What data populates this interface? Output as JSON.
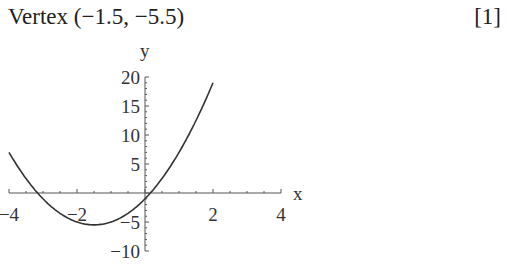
{
  "answer": {
    "text": "Vertex (−1.5, −5.5)",
    "mark": "[1]"
  },
  "chart_data": {
    "type": "line",
    "title": "",
    "xlabel": "x",
    "ylabel": "y",
    "xlim": [
      -4,
      4
    ],
    "ylim": [
      -10,
      20
    ],
    "xticks": [
      "−4",
      "−2",
      "2",
      "4"
    ],
    "yticks": [
      "20",
      "15",
      "10",
      "5",
      "−5",
      "−10"
    ],
    "grid": false,
    "series": [
      {
        "name": "y = 2x² + 6x − 1",
        "x": [
          -4,
          -3.5,
          -3,
          -2.5,
          -2,
          -1.5,
          -1,
          -0.5,
          0,
          0.5,
          1,
          1.5,
          2
        ],
        "y": [
          7,
          2.5,
          -1,
          -3.5,
          -5,
          -5.5,
          -5,
          -3.5,
          -1,
          2.5,
          7,
          12.5,
          19
        ]
      }
    ],
    "vertex": [
      -1.5,
      -5.5
    ]
  }
}
